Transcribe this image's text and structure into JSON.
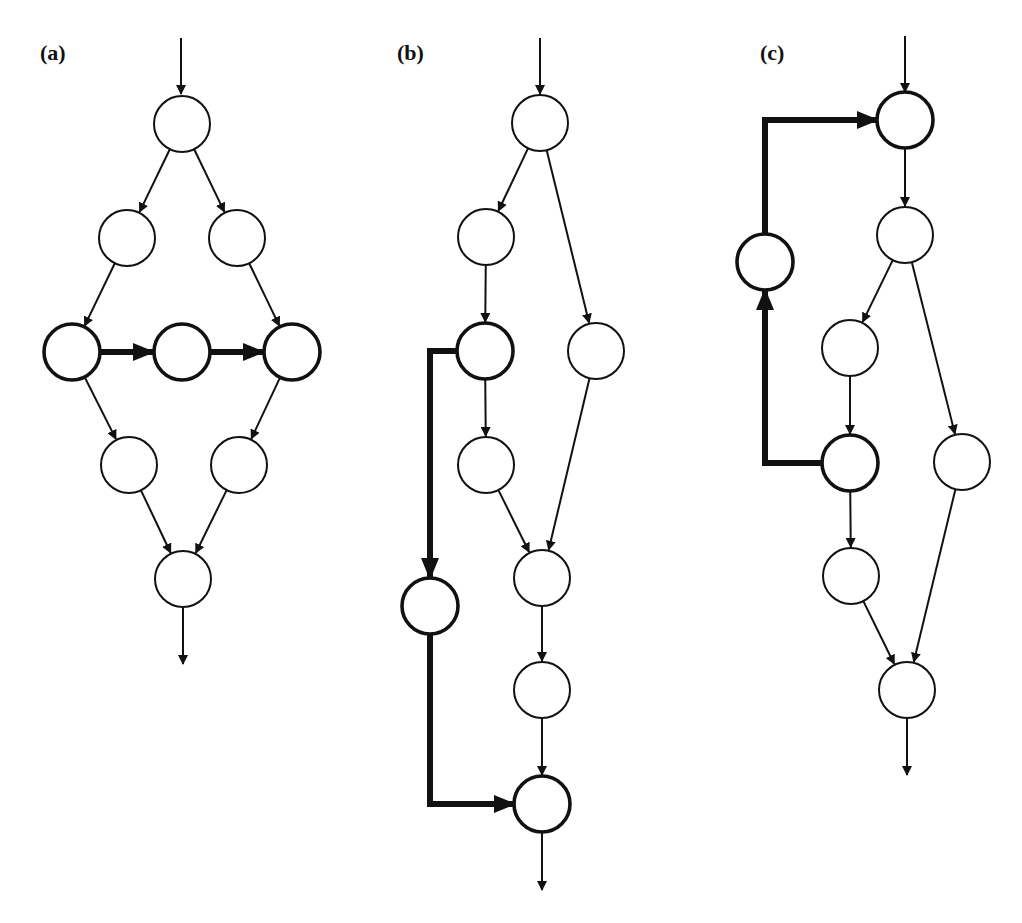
{
  "figure": {
    "panels": [
      {
        "id": "a",
        "label": "(a)",
        "label_pos": [
          40,
          60
        ],
        "entry": {
          "from": [
            181,
            38
          ],
          "to": [
            181,
            94
          ]
        },
        "exit": {
          "from": [
            183,
            607
          ],
          "to": [
            183,
            664
          ]
        },
        "nodes": [
          {
            "id": "a1",
            "cx": 182,
            "cy": 124,
            "thick": false
          },
          {
            "id": "a2",
            "cx": 127,
            "cy": 238,
            "thick": false
          },
          {
            "id": "a3",
            "cx": 237,
            "cy": 238,
            "thick": false
          },
          {
            "id": "a4",
            "cx": 72,
            "cy": 352,
            "thick": true
          },
          {
            "id": "a5",
            "cx": 182,
            "cy": 352,
            "thick": true
          },
          {
            "id": "a6",
            "cx": 292,
            "cy": 352,
            "thick": true
          },
          {
            "id": "a7",
            "cx": 129,
            "cy": 465,
            "thick": false
          },
          {
            "id": "a8",
            "cx": 239,
            "cy": 465,
            "thick": false
          },
          {
            "id": "a9",
            "cx": 183,
            "cy": 579,
            "thick": false
          }
        ],
        "edges": [
          {
            "from": "a1",
            "to": "a2",
            "thick": false
          },
          {
            "from": "a1",
            "to": "a3",
            "thick": false
          },
          {
            "from": "a2",
            "to": "a4",
            "thick": false
          },
          {
            "from": "a3",
            "to": "a6",
            "thick": false
          },
          {
            "from": "a4",
            "to": "a5",
            "thick": true
          },
          {
            "from": "a5",
            "to": "a6",
            "thick": true
          },
          {
            "from": "a4",
            "to": "a7",
            "thick": false
          },
          {
            "from": "a6",
            "to": "a8",
            "thick": false
          },
          {
            "from": "a7",
            "to": "a9",
            "thick": false
          },
          {
            "from": "a8",
            "to": "a9",
            "thick": false
          }
        ],
        "paths": []
      },
      {
        "id": "b",
        "label": "(b)",
        "label_pos": [
          397,
          60
        ],
        "entry": {
          "from": [
            540,
            38
          ],
          "to": [
            540,
            94
          ]
        },
        "exit": {
          "from": [
            542,
            832
          ],
          "to": [
            542,
            890
          ]
        },
        "nodes": [
          {
            "id": "b1",
            "cx": 540,
            "cy": 123,
            "thick": false
          },
          {
            "id": "b2",
            "cx": 486,
            "cy": 237,
            "thick": false
          },
          {
            "id": "b3",
            "cx": 485,
            "cy": 351,
            "thick": true
          },
          {
            "id": "b4",
            "cx": 596,
            "cy": 351,
            "thick": false
          },
          {
            "id": "b5",
            "cx": 486,
            "cy": 465,
            "thick": false
          },
          {
            "id": "b6",
            "cx": 430,
            "cy": 606,
            "thick": true
          },
          {
            "id": "b7",
            "cx": 542,
            "cy": 578,
            "thick": false
          },
          {
            "id": "b8",
            "cx": 542,
            "cy": 690,
            "thick": false
          },
          {
            "id": "b9",
            "cx": 542,
            "cy": 804,
            "thick": true
          }
        ],
        "edges": [
          {
            "from": "b1",
            "to": "b2",
            "thick": false
          },
          {
            "from": "b1",
            "to": "b4",
            "thick": false
          },
          {
            "from": "b2",
            "to": "b3",
            "thick": false
          },
          {
            "from": "b3",
            "to": "b5",
            "thick": false
          },
          {
            "from": "b5",
            "to": "b7",
            "thick": false
          },
          {
            "from": "b4",
            "to": "b7",
            "thick": false
          },
          {
            "from": "b7",
            "to": "b8",
            "thick": false
          },
          {
            "from": "b8",
            "to": "b9",
            "thick": false
          }
        ],
        "paths": [
          {
            "points": [
              [
                457,
                351
              ],
              [
                430,
                351
              ],
              [
                430,
                578
              ]
            ],
            "thick": true
          },
          {
            "points": [
              [
                430,
                634
              ],
              [
                430,
                804
              ],
              [
                514,
                804
              ]
            ],
            "thick": true
          }
        ]
      },
      {
        "id": "c",
        "label": "(c)",
        "label_pos": [
          760,
          60
        ],
        "entry": {
          "from": [
            905,
            36
          ],
          "to": [
            905,
            92
          ]
        },
        "exit": {
          "from": [
            907,
            718
          ],
          "to": [
            907,
            775
          ]
        },
        "nodes": [
          {
            "id": "c1",
            "cx": 905,
            "cy": 120,
            "thick": true
          },
          {
            "id": "c2",
            "cx": 905,
            "cy": 235,
            "thick": false
          },
          {
            "id": "c_side",
            "cx": 765,
            "cy": 262,
            "thick": true
          },
          {
            "id": "c3",
            "cx": 850,
            "cy": 348,
            "thick": false
          },
          {
            "id": "c4",
            "cx": 962,
            "cy": 462,
            "thick": false
          },
          {
            "id": "c5",
            "cx": 850,
            "cy": 463,
            "thick": true
          },
          {
            "id": "c6",
            "cx": 851,
            "cy": 576,
            "thick": false
          },
          {
            "id": "c7",
            "cx": 907,
            "cy": 690,
            "thick": false
          }
        ],
        "edges": [
          {
            "from": "c1",
            "to": "c2",
            "thick": false
          },
          {
            "from": "c2",
            "to": "c3",
            "thick": false
          },
          {
            "from": "c2",
            "to": "c4",
            "thick": false
          },
          {
            "from": "c3",
            "to": "c5",
            "thick": false
          },
          {
            "from": "c5",
            "to": "c6",
            "thick": false
          },
          {
            "from": "c6",
            "to": "c7",
            "thick": false
          },
          {
            "from": "c4",
            "to": "c7",
            "thick": false
          }
        ],
        "paths": [
          {
            "points": [
              [
                822,
                463
              ],
              [
                765,
                463
              ],
              [
                765,
                290
              ]
            ],
            "thick": true
          },
          {
            "points": [
              [
                765,
                234
              ],
              [
                765,
                120
              ],
              [
                877,
                120
              ]
            ],
            "thick": true
          }
        ]
      }
    ],
    "node_radius": 28,
    "stroke_color": "#111111",
    "fill_color": "#ffffff"
  }
}
